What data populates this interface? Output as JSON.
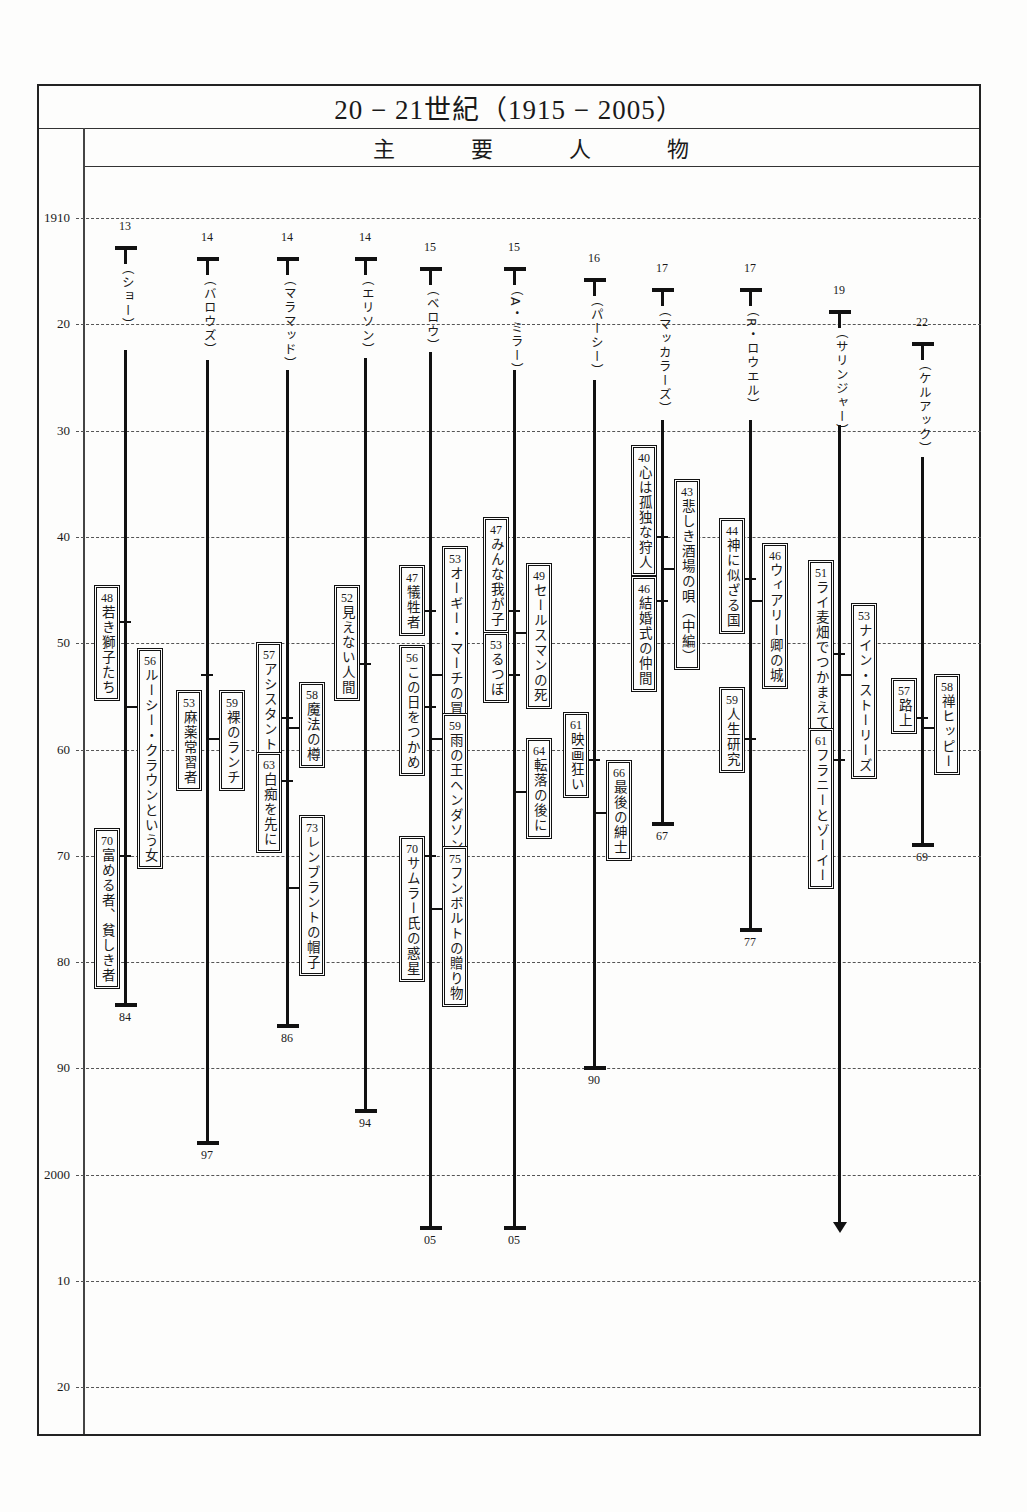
{
  "header": {
    "title": "20 − 21世紀（1915 − 2005）",
    "subtitle": [
      "主",
      "要",
      "人",
      "物"
    ]
  },
  "chart_data": {
    "type": "timeline",
    "title": "20 − 21世紀（1915 − 2005）",
    "subtitle": "主要人物",
    "ylabel": "Year",
    "y_ticks": [
      "1910",
      "20",
      "30",
      "40",
      "50",
      "60",
      "70",
      "80",
      "90",
      "2000",
      "10",
      "20"
    ],
    "ylim": [
      1910,
      2020
    ],
    "grid": "dashed horizontal",
    "people": [
      {
        "name": "（ショー）",
        "born": "13",
        "died": "84",
        "works": [
          {
            "year": "48",
            "title": "若き獅子たち"
          },
          {
            "year": "56",
            "title": "ルーシー・クラウンという女"
          },
          {
            "year": "70",
            "title": "富める者、貧しき者"
          }
        ]
      },
      {
        "name": "（バロウズ）",
        "born": "14",
        "died": "97",
        "works": [
          {
            "year": "53",
            "title": "麻薬常習者"
          },
          {
            "year": "59",
            "title": "裸のランチ"
          }
        ]
      },
      {
        "name": "（マラマッド）",
        "born": "14",
        "died": "86",
        "works": [
          {
            "year": "57",
            "title": "アシスタント"
          },
          {
            "year": "58",
            "title": "魔法の樽"
          },
          {
            "year": "63",
            "title": "白痴を先に"
          },
          {
            "year": "73",
            "title": "レンブラントの帽子"
          }
        ]
      },
      {
        "name": "（エリソン）",
        "born": "14",
        "died": "94",
        "works": [
          {
            "year": "52",
            "title": "見えない人間"
          }
        ]
      },
      {
        "name": "（ベロウ）",
        "born": "15",
        "died": "05",
        "works": [
          {
            "year": "47",
            "title": "犠牲者"
          },
          {
            "year": "53",
            "title": "オーギー・マーチの冒険"
          },
          {
            "year": "56",
            "title": "この日をつかめ"
          },
          {
            "year": "59",
            "title": "雨の王ヘンダソン"
          },
          {
            "year": "70",
            "title": "サムラー氏の惑星"
          },
          {
            "year": "75",
            "title": "フンボルトの贈り物"
          }
        ]
      },
      {
        "name": "（A・ミラー）",
        "born": "15",
        "died": "05",
        "works": [
          {
            "year": "47",
            "title": "みんな我が子"
          },
          {
            "year": "49",
            "title": "セールスマンの死"
          },
          {
            "year": "53",
            "title": "るつぼ"
          },
          {
            "year": "64",
            "title": "転落の後に"
          }
        ]
      },
      {
        "name": "（パーシー）",
        "born": "16",
        "died": "90",
        "works": [
          {
            "year": "61",
            "title": "映画狂い"
          },
          {
            "year": "66",
            "title": "最後の紳士"
          }
        ]
      },
      {
        "name": "（マッカラーズ）",
        "born": "17",
        "died": "67",
        "works": [
          {
            "year": "40",
            "title": "心は孤独な狩人"
          },
          {
            "year": "43",
            "title": "悲しき酒場の唄（中編）"
          },
          {
            "year": "46",
            "title": "結婚式の仲間"
          }
        ]
      },
      {
        "name": "（R・ロウエル）",
        "born": "17",
        "died": "77",
        "works": [
          {
            "year": "44",
            "title": "神に似ざる国"
          },
          {
            "year": "46",
            "title": "ウィアリー卿の城"
          },
          {
            "year": "59",
            "title": "人生研究"
          }
        ]
      },
      {
        "name": "（サリンジャー）",
        "born": "19",
        "died": "",
        "living": true,
        "works": [
          {
            "year": "51",
            "title": "ライ麦畑でつかまえて"
          },
          {
            "year": "53",
            "title": "ナイン・ストーリーズ"
          },
          {
            "year": "61",
            "title": "フラニーとゾーイー"
          }
        ]
      },
      {
        "name": "（ケルアック）",
        "born": "22",
        "died": "69",
        "works": [
          {
            "year": "57",
            "title": "路上"
          },
          {
            "year": "58",
            "title": "禅ヒッピー"
          }
        ]
      }
    ]
  }
}
